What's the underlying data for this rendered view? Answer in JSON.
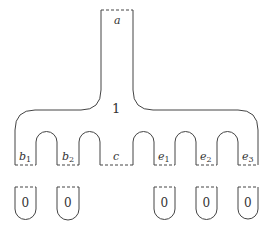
{
  "diagram": {
    "top_boundary_label": "a",
    "main_surface_label": "1",
    "bottom_boundaries": [
      {
        "label": "b",
        "sub": "1"
      },
      {
        "label": "b",
        "sub": "2"
      },
      {
        "label": "c",
        "sub": ""
      },
      {
        "label": "e",
        "sub": "1"
      },
      {
        "label": "e",
        "sub": "2"
      },
      {
        "label": "e",
        "sub": "3"
      }
    ],
    "caps": [
      {
        "label": "0"
      },
      {
        "label": "0"
      },
      {
        "label": "0"
      },
      {
        "label": "0"
      },
      {
        "label": "0"
      }
    ],
    "colors": {
      "stroke": "#444444",
      "text": "#333333",
      "background": "#ffffff"
    }
  }
}
